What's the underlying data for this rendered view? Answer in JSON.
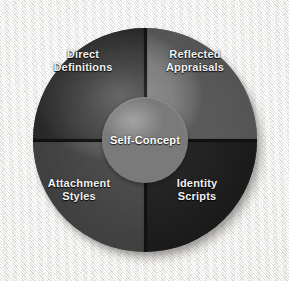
{
  "diagram": {
    "type": "radial-quadrant-wheel",
    "title": "Self-Concept",
    "center": {
      "label": "Self-Concept",
      "lines": [
        "Self-Concept"
      ]
    },
    "quadrants": [
      {
        "id": "direct-definitions",
        "position": "top-left",
        "label": "Direct Definitions",
        "lines": [
          "Direct",
          "Definitions"
        ],
        "fill": "#3b3b3b"
      },
      {
        "id": "reflected-appraisals",
        "position": "top-right",
        "label": "Reflected Appraisals",
        "lines": [
          "Reflected",
          "Appraisals"
        ],
        "fill": "#7c7c7c"
      },
      {
        "id": "attachment-styles",
        "position": "bottom-left",
        "label": "Attachment Styles",
        "lines": [
          "Attachment",
          "Styles"
        ],
        "fill": "#5c5c5c"
      },
      {
        "id": "identity-scripts",
        "position": "bottom-right",
        "label": "Identity Scripts",
        "lines": [
          "Identity",
          "Scripts"
        ],
        "fill": "#262626"
      }
    ],
    "colors": {
      "background": "#eeecea",
      "hub": "#8e8e8e",
      "divider": "#17181a",
      "label_text": "#f2f2f2"
    }
  }
}
